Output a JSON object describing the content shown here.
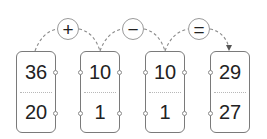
{
  "operators": [
    {
      "symbol": "+",
      "name": "plus"
    },
    {
      "symbol": "−",
      "name": "minus"
    },
    {
      "symbol": "=",
      "name": "equals"
    }
  ],
  "cards": [
    {
      "top": "36",
      "bottom": "20"
    },
    {
      "top": "10",
      "bottom": "1"
    },
    {
      "top": "10",
      "bottom": "1"
    },
    {
      "top": "29",
      "bottom": "27"
    }
  ],
  "colors": {
    "border": "#7a7a7a",
    "circle": "#9a9a9a",
    "dash": "#8a8a8a",
    "text": "#222222"
  }
}
